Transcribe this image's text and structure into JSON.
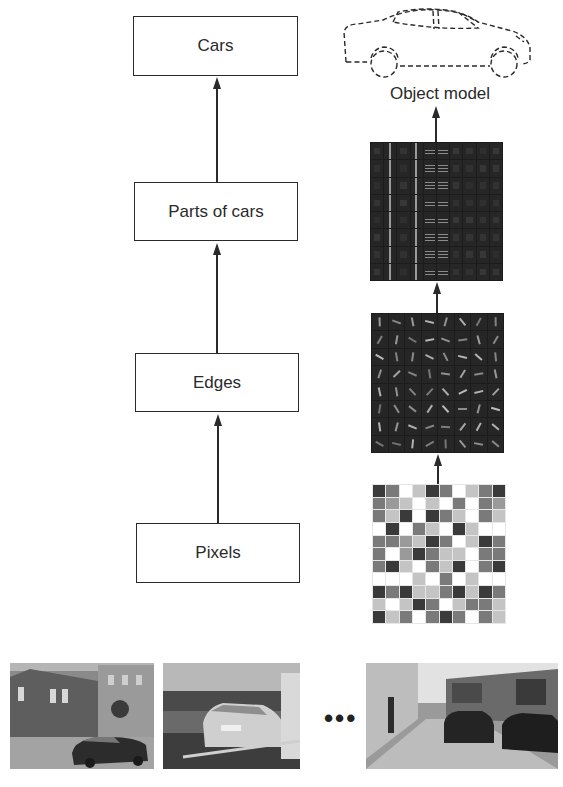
{
  "hierarchy": {
    "boxes": [
      {
        "id": "cars",
        "label": "Cars"
      },
      {
        "id": "parts",
        "label": "Parts of cars"
      },
      {
        "id": "edges",
        "label": "Edges"
      },
      {
        "id": "pixels",
        "label": "Pixels"
      }
    ]
  },
  "representations": {
    "object_model_label": "Object model",
    "parts_features": {
      "rows": 8,
      "cols": 10
    },
    "edge_features": {
      "rows": 8,
      "cols": 8
    },
    "pixel_grid": {
      "rows": 11,
      "cols": 10,
      "palette": {
        "D": "#3a3a3a",
        "M": "#7a7a7a",
        "S": "#9a9a9a",
        "L": "#c4c4c4",
        "W": "#ffffff"
      },
      "cells": [
        "DMWLDMWLMD",
        "MSLWLWMWMS",
        "MLDWDMLWML",
        "WDWMLWDLWW",
        "MMSLDMWLDM",
        "MWSDMLLWMM",
        "MDLWMLDWMD",
        "WWWLWMWLWW",
        "DMDLLMDLDM",
        "LWLDMWLMML",
        "DLMWMDMWML"
      ]
    }
  },
  "input_images": {
    "ellipsis": "•••",
    "photos": [
      {
        "id": "street-corner-car"
      },
      {
        "id": "parked-silver-car"
      },
      {
        "id": "narrow-street-cars"
      }
    ]
  }
}
